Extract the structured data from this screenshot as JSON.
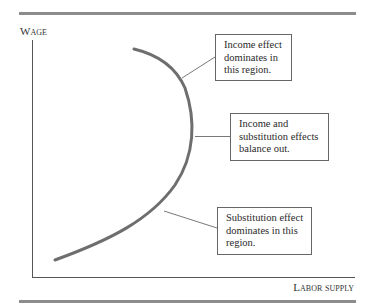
{
  "diagram": {
    "type": "backward-bending labor supply curve",
    "axes": {
      "y_label": "Wage",
      "x_label": "Labor supply"
    },
    "callouts": [
      {
        "id": "income",
        "text": "Income effect dominates in this region."
      },
      {
        "id": "balance",
        "text": "Income and substitution effects balance out."
      },
      {
        "id": "substitution",
        "text": "Substitution effect dominates in this region."
      }
    ],
    "colors": {
      "curve": "#6e6e6e",
      "axis": "#555555",
      "rule": "#8c8c8c",
      "callout_border": "#666666"
    }
  }
}
